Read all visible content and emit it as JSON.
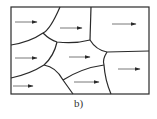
{
  "figure": {
    "caption": "b)",
    "colors": {
      "line": "#2a2a2a",
      "background": "#ffffff"
    },
    "frame": {
      "x": 11,
      "y": 7,
      "width": 138,
      "height": 87
    },
    "domain_walls": [
      "M 60 7 Q 50 30 43 33 Q 30 42 11 45",
      "M 43 33 Q 50 40 57 42 Q 75 44 90 40",
      "M 91 7 L 90 40",
      "M 90 40 Q 96 50 107 52 L 149 51",
      "M 57 42 Q 54 56 44 65",
      "M 44 65 Q 30 74 11 78",
      "M 44 65 Q 56 67 63 80 L 73 94",
      "M 63 80 Q 82 68 104 65",
      "M 107 52 Q 102 60 104 65 Q 105 80 111 94"
    ],
    "arrows": [
      {
        "x1": 15,
        "y1": 22,
        "x2": 37,
        "y2": 22
      },
      {
        "x1": 60,
        "y1": 28,
        "x2": 82,
        "y2": 28
      },
      {
        "x1": 112,
        "y1": 24,
        "x2": 136,
        "y2": 24
      },
      {
        "x1": 15,
        "y1": 58,
        "x2": 37,
        "y2": 58
      },
      {
        "x1": 69,
        "y1": 57,
        "x2": 90,
        "y2": 57
      },
      {
        "x1": 118,
        "y1": 69,
        "x2": 140,
        "y2": 69
      },
      {
        "x1": 74,
        "y1": 82,
        "x2": 99,
        "y2": 82
      },
      {
        "x1": 13,
        "y1": 86,
        "x2": 33,
        "y2": 86
      }
    ]
  }
}
